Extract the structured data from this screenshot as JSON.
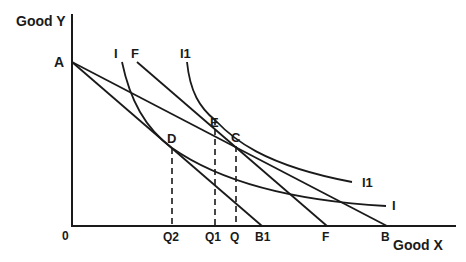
{
  "diagram": {
    "type": "budget-line-indifference-curve",
    "axes": {
      "y_label": "Good Y",
      "x_label": "Good X",
      "origin_label": "0"
    },
    "points": {
      "A": "A",
      "D": "D",
      "E": "E",
      "C": "C"
    },
    "curve_labels": {
      "I_top": "I",
      "F_top": "F",
      "I1_top": "I1",
      "I1_right": "I1",
      "I_right": "I"
    },
    "x_ticks": {
      "Q2": "Q2",
      "Q1": "Q1",
      "Q": "Q",
      "B1": "B1",
      "F": "F",
      "B": "B"
    },
    "lines": [
      {
        "name": "budget-line-AB",
        "from": "A",
        "to": "B"
      },
      {
        "name": "budget-line-AB1",
        "from": "A",
        "to": "B1"
      },
      {
        "name": "compensating-line-F",
        "from": "F_top",
        "to": "F"
      }
    ],
    "indifference_curves": [
      {
        "name": "I",
        "tangent_points": [
          "D"
        ]
      },
      {
        "name": "I1",
        "tangent_points": [
          "E",
          "C"
        ]
      }
    ],
    "dropped_lines": [
      "D→Q2",
      "E→Q1",
      "C→Q"
    ]
  }
}
